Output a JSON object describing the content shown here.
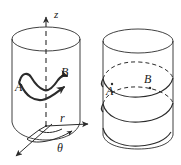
{
  "figure": {
    "background_color": "#ffffff",
    "stroke_color": "#2b2b2b",
    "width": 181,
    "height": 165
  },
  "left_panel": {
    "name": "cylinder-with-cylindrical-coordinate-axes",
    "axes": [
      {
        "id": "z-axis",
        "label": "z",
        "style": "dashed-vertical-with-arrow",
        "direction": "up"
      },
      {
        "id": "r-axis",
        "label": "r",
        "style": "solid-with-arrow",
        "direction": "right"
      },
      {
        "id": "theta-angle",
        "label": "θ",
        "style": "curved-arc-arrow",
        "direction": "from-diagonal-to-r"
      },
      {
        "id": "diagonal-reference-axis",
        "label": "",
        "style": "solid-with-arrow",
        "direction": "down-left"
      }
    ],
    "points": [
      {
        "id": "point-A",
        "label": "A"
      },
      {
        "id": "point-B",
        "label": "B"
      }
    ],
    "path": {
      "id": "wavy-path-A-to-B",
      "description": "thick irregular wavy curve with arrowhead at B",
      "from": "A",
      "to": "B",
      "arrowhead": "at-B"
    }
  },
  "right_panel": {
    "name": "cylinder-with-helical-path",
    "points": [
      {
        "id": "point-A",
        "label": "A"
      },
      {
        "id": "point-B",
        "label": "B"
      }
    ],
    "path": {
      "id": "helix-path-A-to-B",
      "description": "helical curve wrapping the cylinder; hidden back segments drawn dashed",
      "from": "A",
      "to": "B",
      "turns": 3,
      "hidden_segments_style": "dashed"
    }
  }
}
